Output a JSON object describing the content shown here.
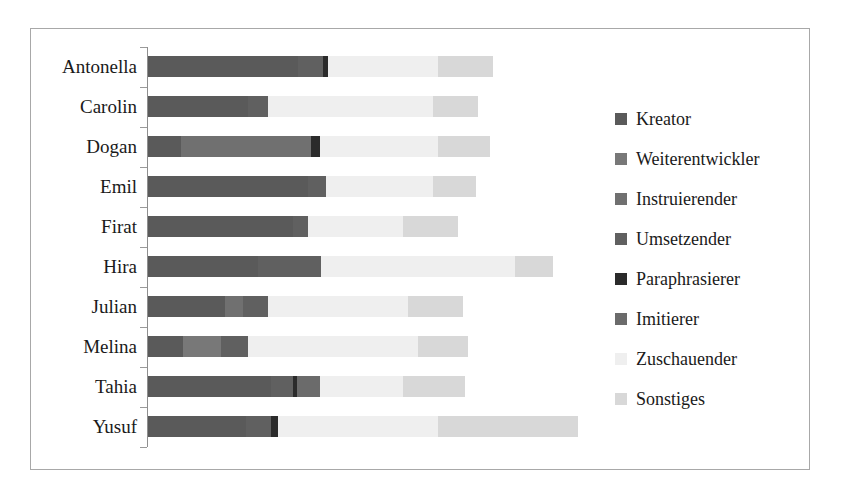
{
  "chart_data": {
    "type": "bar",
    "subtype": "stacked-horizontal",
    "title": "",
    "xlabel": "",
    "ylabel": "",
    "grid": false,
    "legend_position": "right",
    "axis_visible": true,
    "xlim": [
      0,
      560
    ],
    "categories": [
      "Antonella",
      "Carolin",
      "Dogan",
      "Emil",
      "Firat",
      "Hira",
      "Julian",
      "Melina",
      "Tahia",
      "Yusuf"
    ],
    "series": [
      {
        "name": "Kreator",
        "color": "#5a5a5a",
        "values": [
          150,
          100,
          33,
          160,
          145,
          110,
          77,
          35,
          123,
          98
        ]
      },
      {
        "name": "Weiterentwickler",
        "color": "#787878",
        "values": [
          0,
          0,
          0,
          0,
          0,
          0,
          0,
          38,
          0,
          0
        ]
      },
      {
        "name": "Instruierender",
        "color": "#707070",
        "values": [
          0,
          0,
          130,
          0,
          0,
          0,
          18,
          0,
          0,
          0
        ]
      },
      {
        "name": "Umsetzender",
        "color": "#606060",
        "values": [
          25,
          20,
          0,
          18,
          15,
          63,
          25,
          27,
          22,
          25
        ]
      },
      {
        "name": "Paraphrasierer",
        "color": "#2b2b2b",
        "values": [
          5,
          0,
          9,
          0,
          0,
          0,
          0,
          0,
          4,
          7
        ]
      },
      {
        "name": "Imitierer",
        "color": "#6b6b6b",
        "values": [
          0,
          0,
          0,
          0,
          0,
          0,
          0,
          0,
          23,
          0
        ]
      },
      {
        "name": "Zuschauender",
        "color": "#efefef",
        "values": [
          110,
          165,
          118,
          107,
          95,
          194,
          140,
          170,
          83,
          160
        ]
      },
      {
        "name": "Sonstiges",
        "color": "#d8d8d8",
        "values": [
          55,
          45,
          52,
          43,
          55,
          38,
          55,
          50,
          62,
          140
        ]
      }
    ]
  },
  "legend": {
    "items": [
      {
        "label": "Kreator"
      },
      {
        "label": "Weiterentwickler"
      },
      {
        "label": "Instruierender"
      },
      {
        "label": "Umsetzender"
      },
      {
        "label": "Paraphrasierer"
      },
      {
        "label": "Imitierer"
      },
      {
        "label": "Zuschauender"
      },
      {
        "label": "Sonstiges"
      }
    ]
  }
}
